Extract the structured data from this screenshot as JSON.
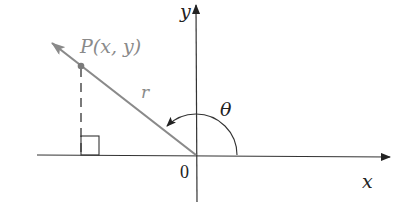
{
  "diagram": {
    "type": "polar-coordinate-angle",
    "labels": {
      "y_axis": "y",
      "x_axis": "x",
      "origin": "0",
      "point": "P(x, y)",
      "radius": "r",
      "angle": "θ"
    },
    "colors": {
      "axes": "#222222",
      "ray": "#8a8a8a",
      "point_label": "#8a8a8a",
      "text": "#222222"
    },
    "geometry": {
      "origin": [
        196,
        155
      ],
      "point_P": [
        81,
        66
      ],
      "ray_tip": [
        52,
        43
      ],
      "arc_radius": 40
    }
  }
}
